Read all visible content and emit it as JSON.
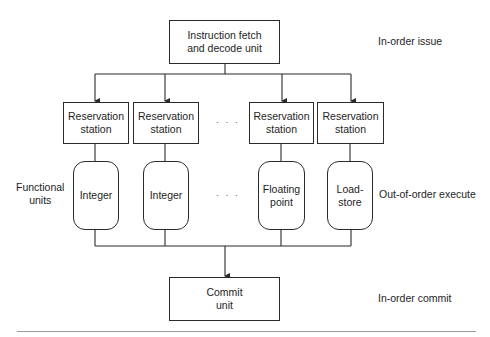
{
  "diagram": {
    "fetch_unit": {
      "label": "Instruction fetch\nand decode unit"
    },
    "reservation_stations": [
      {
        "label": "Reservation\nstation"
      },
      {
        "label": "Reservation\nstation"
      },
      {
        "label": "Reservation\nstation"
      },
      {
        "label": "Reservation\nstation"
      }
    ],
    "functional_units": [
      {
        "label": "Integer"
      },
      {
        "label": "Integer"
      },
      {
        "label": "Floating\npoint"
      },
      {
        "label": "Load-\nstore"
      }
    ],
    "commit_unit": {
      "label": "Commit\nunit"
    },
    "ellipsis": "· · ·",
    "side_labels": {
      "functional_units": "Functional\nunits",
      "in_order_issue": "In-order issue",
      "out_of_order_execute": "Out-of-order execute",
      "in_order_commit": "In-order commit"
    }
  }
}
